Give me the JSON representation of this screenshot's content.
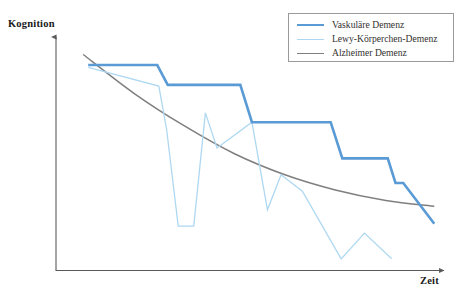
{
  "chart_data": {
    "type": "line",
    "title": "",
    "subtitle": "",
    "xlabel": "Zeit",
    "ylabel": "Kognition",
    "grid": false,
    "legend_position": "top-right",
    "axis_style": "arrow-axes-no-ticks",
    "xlim": [
      0,
      100
    ],
    "ylim": [
      0,
      100
    ],
    "note": "Schematic illustration: cognition decline over time for three dementia types. Axes are unlabeled/qualitative.",
    "series": [
      {
        "name": "Vaskuläre Demenz",
        "color": "#5B9BD5",
        "width": 2.6,
        "style": "step",
        "points": [
          {
            "x": 8.3,
            "y": 88.0
          },
          {
            "x": 26.1,
            "y": 88.0
          },
          {
            "x": 28.8,
            "y": 79.5
          },
          {
            "x": 47.5,
            "y": 79.5
          },
          {
            "x": 50.5,
            "y": 63.5
          },
          {
            "x": 70.8,
            "y": 63.5
          },
          {
            "x": 73.8,
            "y": 48.0
          },
          {
            "x": 85.5,
            "y": 48.0
          },
          {
            "x": 87.5,
            "y": 37.5
          },
          {
            "x": 89.5,
            "y": 37.5
          },
          {
            "x": 97.5,
            "y": 20.0
          }
        ]
      },
      {
        "name": "Lewy-Körperchen-Demenz",
        "color": "#AED8F2",
        "width": 1.3,
        "style": "zigzag",
        "points": [
          {
            "x": 8.3,
            "y": 87.0
          },
          {
            "x": 26.5,
            "y": 79.0
          },
          {
            "x": 28.5,
            "y": 60.5
          },
          {
            "x": 31.5,
            "y": 19.0
          },
          {
            "x": 35.5,
            "y": 19.0
          },
          {
            "x": 38.5,
            "y": 67.5
          },
          {
            "x": 41.5,
            "y": 52.5
          },
          {
            "x": 50.5,
            "y": 63.5
          },
          {
            "x": 54.5,
            "y": 26.0
          },
          {
            "x": 58.0,
            "y": 41.0
          },
          {
            "x": 63.5,
            "y": 34.0
          },
          {
            "x": 73.5,
            "y": 5.0
          },
          {
            "x": 79.5,
            "y": 16.0
          },
          {
            "x": 86.5,
            "y": 5.0
          }
        ]
      },
      {
        "name": "Alzheimer Demenz",
        "color": "#7f7f7f",
        "width": 1.5,
        "style": "smooth-decay",
        "points": [
          {
            "x": 7.0,
            "y": 92.5
          },
          {
            "x": 20.0,
            "y": 76.0
          },
          {
            "x": 33.0,
            "y": 62.0
          },
          {
            "x": 46.0,
            "y": 50.0
          },
          {
            "x": 59.0,
            "y": 41.0
          },
          {
            "x": 72.0,
            "y": 34.5
          },
          {
            "x": 85.0,
            "y": 30.0
          },
          {
            "x": 97.5,
            "y": 27.5
          }
        ]
      }
    ]
  },
  "legend": {
    "items": [
      {
        "label": "Vaskuläre Demenz",
        "color": "#5B9BD5"
      },
      {
        "label": "Lewy-Körperchen-Demenz",
        "color": "#AED8F2"
      },
      {
        "label": "Alzheimer Demenz",
        "color": "#7f7f7f"
      }
    ]
  },
  "axes": {
    "y_title": "Kognition",
    "x_title": "Zeit",
    "axis_color": "#595959"
  }
}
